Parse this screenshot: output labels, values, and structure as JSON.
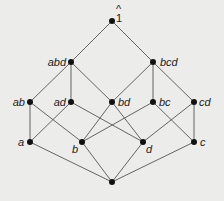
{
  "diagram": {
    "type": "hasse-diagram",
    "colors": {
      "background": "#ececea",
      "edge": "#555555",
      "node": "#111111",
      "label": "#222222"
    },
    "nodes": [
      {
        "id": "top",
        "label": "1",
        "hat": "^",
        "x": 112,
        "y": 21
      },
      {
        "id": "abd",
        "label": "abd",
        "x": 71,
        "y": 62
      },
      {
        "id": "bcd",
        "label": "bcd",
        "x": 153,
        "y": 62
      },
      {
        "id": "ab",
        "label": "ab",
        "x": 30,
        "y": 102
      },
      {
        "id": "ad",
        "label": "ad",
        "x": 71,
        "y": 102
      },
      {
        "id": "bd",
        "label": "bd",
        "x": 112,
        "y": 102
      },
      {
        "id": "bc",
        "label": "bc",
        "x": 153,
        "y": 102
      },
      {
        "id": "cd",
        "label": "cd",
        "x": 194,
        "y": 102
      },
      {
        "id": "a",
        "label": "a",
        "x": 30,
        "y": 142
      },
      {
        "id": "b",
        "label": "b",
        "x": 82,
        "y": 142
      },
      {
        "id": "d",
        "label": "d",
        "x": 143,
        "y": 142
      },
      {
        "id": "c",
        "label": "c",
        "x": 194,
        "y": 142
      },
      {
        "id": "bottom",
        "label": "",
        "x": 112,
        "y": 182
      }
    ],
    "edges": [
      [
        "top",
        "abd"
      ],
      [
        "top",
        "bcd"
      ],
      [
        "abd",
        "ab"
      ],
      [
        "abd",
        "ad"
      ],
      [
        "abd",
        "bd"
      ],
      [
        "bcd",
        "bd"
      ],
      [
        "bcd",
        "bc"
      ],
      [
        "bcd",
        "cd"
      ],
      [
        "ab",
        "a"
      ],
      [
        "ab",
        "b"
      ],
      [
        "ad",
        "a"
      ],
      [
        "ad",
        "d"
      ],
      [
        "bd",
        "b"
      ],
      [
        "bd",
        "d"
      ],
      [
        "bc",
        "b"
      ],
      [
        "bc",
        "c"
      ],
      [
        "cd",
        "d"
      ],
      [
        "cd",
        "c"
      ],
      [
        "a",
        "bottom"
      ],
      [
        "b",
        "bottom"
      ],
      [
        "d",
        "bottom"
      ],
      [
        "c",
        "bottom"
      ]
    ]
  }
}
